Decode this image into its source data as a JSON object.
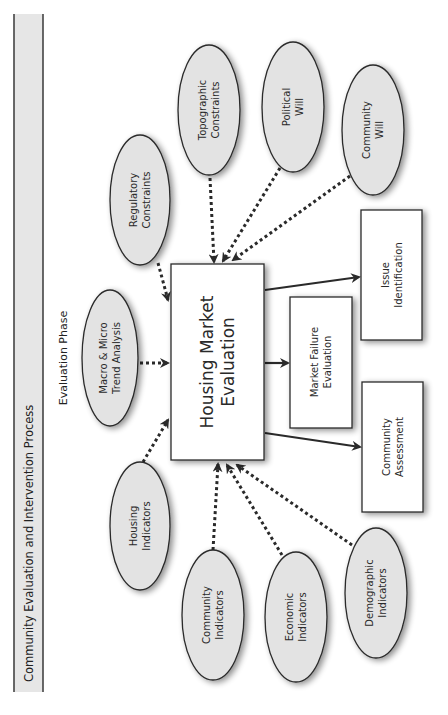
{
  "header": {
    "title": "Community Evaluation and Intervention Process",
    "fill": "#e6e6e6",
    "border": "#444444"
  },
  "phase_label": "Evaluation Phase",
  "central_node": {
    "lines": [
      "Housing Market",
      "Evaluation"
    ]
  },
  "input_nodes": [
    {
      "id": "regulatory",
      "lines": [
        "Regulatory",
        "Constraints"
      ]
    },
    {
      "id": "topographic",
      "lines": [
        "Topographic",
        "Constraints"
      ]
    },
    {
      "id": "political",
      "lines": [
        "Political",
        "Will"
      ]
    },
    {
      "id": "community-will",
      "lines": [
        "Community",
        "Will"
      ]
    },
    {
      "id": "macro-micro",
      "lines": [
        "Macro & Micro",
        "Trend Analysis"
      ]
    },
    {
      "id": "housing",
      "lines": [
        "Housing",
        "Indicators"
      ]
    },
    {
      "id": "community-ind",
      "lines": [
        "Community",
        "Indicators"
      ]
    },
    {
      "id": "economic",
      "lines": [
        "Economic",
        "Indicators"
      ]
    },
    {
      "id": "demographic",
      "lines": [
        "Demographic",
        "Indicators"
      ]
    }
  ],
  "output_nodes": [
    {
      "id": "issue",
      "lines": [
        "Issue",
        "Identification"
      ]
    },
    {
      "id": "market-failure",
      "lines": [
        "Market Failure",
        "Evaluation"
      ]
    },
    {
      "id": "community-assessment",
      "lines": [
        "Community",
        "Assessment"
      ]
    }
  ],
  "colors": {
    "ellipse_fill": "#e3e3e3",
    "stroke": "#2a2a2a",
    "arrow": "#2a2a2a",
    "box_fill": "#ffffff"
  }
}
